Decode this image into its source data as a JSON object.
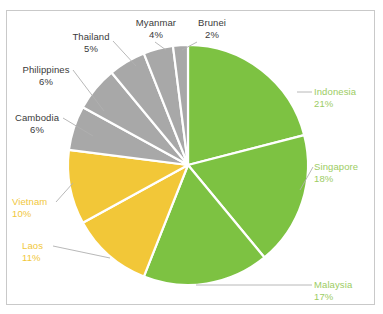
{
  "chart_data": {
    "type": "pie",
    "title": "",
    "subtitle": "",
    "xlabel": "",
    "ylabel": "",
    "legend_position": "none",
    "grid": false,
    "value_unit": "%",
    "categories": [
      "Indonesia",
      "Singapore",
      "Malaysia",
      "Laos",
      "Vietnam",
      "Cambodia",
      "Philippines",
      "Thailand",
      "Myanmar",
      "Brunei"
    ],
    "values": [
      21,
      18,
      17,
      11,
      10,
      6,
      6,
      5,
      4,
      2
    ],
    "slices": [
      {
        "label": "Indonesia",
        "percent_text": "21%",
        "value": 21,
        "color": "#7dc242",
        "label_color": "#9ccc63",
        "group": "green"
      },
      {
        "label": "Singapore",
        "percent_text": "18%",
        "value": 18,
        "color": "#7dc242",
        "label_color": "#9ccc63",
        "group": "green"
      },
      {
        "label": "Malaysia",
        "percent_text": "17%",
        "value": 17,
        "color": "#7dc242",
        "label_color": "#9ccc63",
        "group": "green"
      },
      {
        "label": "Laos",
        "percent_text": "11%",
        "value": 11,
        "color": "#f2c738",
        "label_color": "#f1c73b",
        "group": "yellow"
      },
      {
        "label": "Vietnam",
        "percent_text": "10%",
        "value": 10,
        "color": "#f2c738",
        "label_color": "#f1c73b",
        "group": "yellow"
      },
      {
        "label": "Cambodia",
        "percent_text": "6%",
        "value": 6,
        "color": "#a8a8a8",
        "label_color": "#3a3a3a",
        "group": "gray"
      },
      {
        "label": "Philippines",
        "percent_text": "6%",
        "value": 6,
        "color": "#a8a8a8",
        "label_color": "#3a3a3a",
        "group": "gray"
      },
      {
        "label": "Thailand",
        "percent_text": "5%",
        "value": 5,
        "color": "#a8a8a8",
        "label_color": "#3a3a3a",
        "group": "gray"
      },
      {
        "label": "Myanmar",
        "percent_text": "4%",
        "value": 4,
        "color": "#a8a8a8",
        "label_color": "#3a3a3a",
        "group": "gray"
      },
      {
        "label": "Brunei",
        "percent_text": "2%",
        "value": 2,
        "color": "#a8a8a8",
        "label_color": "#3a3a3a",
        "group": "gray"
      }
    ],
    "colors": {
      "green": "#7dc242",
      "yellow": "#f2c738",
      "gray": "#a8a8a8",
      "slice_separator": "#ffffff",
      "leader_line": "#b0b0b0",
      "frame": "#c9c9c9",
      "background": "#ffffff"
    }
  }
}
